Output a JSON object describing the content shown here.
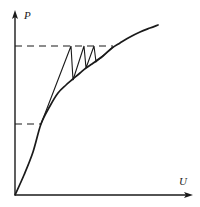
{
  "figure": {
    "background_color": "#ffffff",
    "ink_color": "#1a1a1a",
    "width": 200,
    "height": 207
  },
  "axes": {
    "vertical": {
      "label": "P",
      "name": "power-axis",
      "x": 15,
      "y_top": 12,
      "y_bottom": 195,
      "arrow": "up",
      "label_x": 24,
      "label_y": 19
    },
    "horizontal": {
      "label": "U",
      "name": "voltage-axis",
      "y": 195,
      "x_left": 15,
      "x_right": 191,
      "arrow": "right",
      "label_x": 179,
      "label_y": 185
    }
  },
  "chart_data": {
    "type": "line",
    "title": "",
    "xlabel": "U",
    "ylabel": "P",
    "grid": false,
    "legend": null,
    "xlim": [
      0,
      1
    ],
    "ylim": [
      0,
      1
    ],
    "series": [
      {
        "name": "characteristic-curve",
        "style": "solid",
        "description": "Concave increasing curve from origin, saturating at right",
        "points_px": [
          [
            15,
            195
          ],
          [
            24,
            175
          ],
          [
            33,
            152
          ],
          [
            41,
            124
          ],
          [
            50,
            106
          ],
          [
            58,
            93
          ],
          [
            66,
            85
          ],
          [
            73,
            79
          ],
          [
            80,
            73
          ],
          [
            86,
            68
          ],
          [
            92,
            64
          ],
          [
            96,
            61
          ],
          [
            103,
            56
          ],
          [
            112,
            48
          ],
          [
            120,
            43
          ],
          [
            130,
            37
          ],
          [
            140,
            32
          ],
          [
            150,
            28
          ],
          [
            158,
            25
          ]
        ]
      },
      {
        "name": "staircase-path",
        "style": "solid",
        "description": "Cobweb/staircase iteration between lower operating point and upper level",
        "points_px": [
          [
            41,
            124
          ],
          [
            71,
            46
          ],
          [
            73,
            80
          ],
          [
            84,
            46
          ],
          [
            86,
            68
          ],
          [
            94,
            46
          ],
          [
            96,
            62
          ],
          [
            113,
            47
          ]
        ]
      }
    ],
    "reference_lines": [
      {
        "name": "upper-level-dashed-line",
        "orientation": "horizontal",
        "style": "dashed",
        "y_px": 46,
        "x_start_px": 15,
        "x_end_px": 113
      },
      {
        "name": "lower-level-dashed-line",
        "orientation": "horizontal",
        "style": "dashed",
        "y_px": 124,
        "x_start_px": 15,
        "x_end_px": 41
      }
    ],
    "markers": [
      {
        "name": "lower-operating-point",
        "x_px": 41,
        "y_px": 124
      },
      {
        "name": "upper-operating-point",
        "x_px": 113,
        "y_px": 47
      }
    ]
  }
}
